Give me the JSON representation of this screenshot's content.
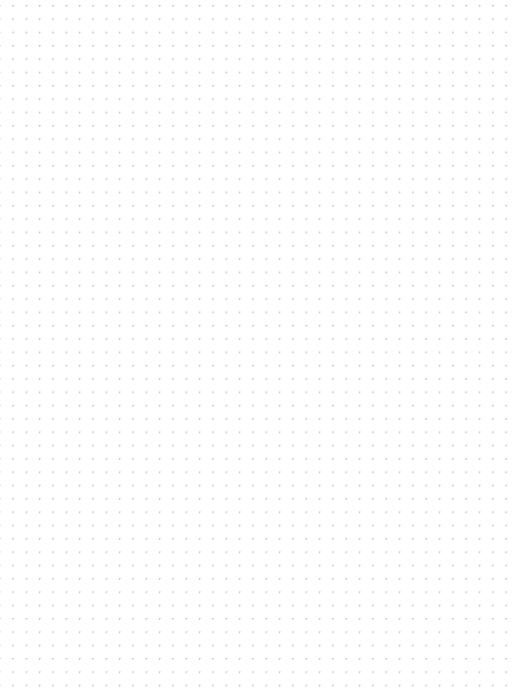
{
  "document": {
    "kind": "dot-grid-paper",
    "title": "Dot Grid Paper",
    "page_width": 517,
    "page_height": 688,
    "background_color": "#ffffff"
  },
  "grid": {
    "pattern": "dots",
    "dot_color": "#b9b9c1",
    "dot_diameter": 1.3,
    "spacing_x": 13.33,
    "spacing_y": 13.33,
    "origin_x": 13,
    "origin_y": 19,
    "columns": 38,
    "rows": 50,
    "margin_left": 13,
    "margin_top": 19,
    "margin_right": 11,
    "margin_bottom": 16
  },
  "content": {
    "text": "",
    "annotations": []
  }
}
